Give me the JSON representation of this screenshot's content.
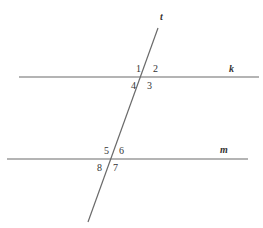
{
  "diagram": {
    "lines": {
      "transversal": "t",
      "parallel_top": "k",
      "parallel_bottom": "m"
    },
    "angles_top": [
      "1",
      "2",
      "3",
      "4"
    ],
    "angles_bottom": [
      "5",
      "6",
      "7",
      "8"
    ],
    "colors": {
      "line": "#6a6a6a",
      "text": "#333333"
    }
  }
}
